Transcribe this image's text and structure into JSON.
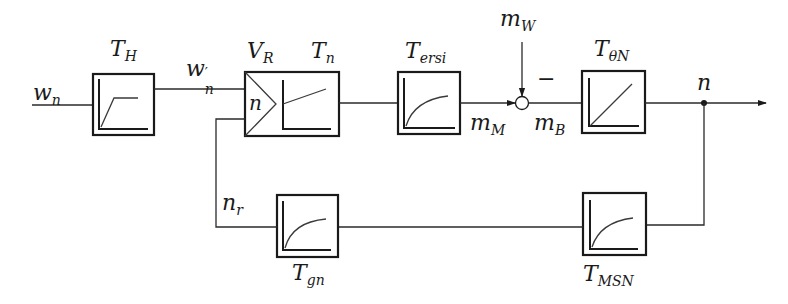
{
  "diagram": {
    "type": "control-loop-block-diagram",
    "signals": {
      "input": {
        "base": "w",
        "sub": "n"
      },
      "prefiltered": {
        "base": "w",
        "sub": "n",
        "prime": "′"
      },
      "motor_torque": {
        "base": "m",
        "sub": "M"
      },
      "disturbance": {
        "base": "m",
        "sub": "W"
      },
      "accel_torque": {
        "base": "m",
        "sub": "B"
      },
      "output": {
        "base": "n"
      },
      "feedback": {
        "base": "n",
        "sub": "r"
      },
      "minus_sign": "−"
    },
    "blocks": [
      {
        "id": "prefilter",
        "base": "T",
        "sub": "H",
        "response": "ramp-saturation"
      },
      {
        "id": "controller",
        "gain_base": "V",
        "gain_sub": "R",
        "base": "T",
        "sub": "n",
        "response": "PI-step",
        "comparator_label": "n"
      },
      {
        "id": "current-loop",
        "base": "T",
        "sub": "ersi",
        "response": "first-order-lag"
      },
      {
        "id": "mechanics",
        "base": "T",
        "sub": "θN",
        "response": "integrator"
      },
      {
        "id": "measurement",
        "base": "T",
        "sub": "MSN",
        "response": "first-order-lag"
      },
      {
        "id": "feedback-filter",
        "base": "T",
        "sub": "gn",
        "response": "first-order-lag"
      }
    ]
  }
}
